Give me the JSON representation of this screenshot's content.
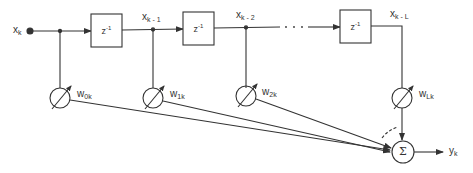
{
  "diagram": {
    "type": "adaptive transversal filter (tapped delay line)",
    "input": {
      "label": "x",
      "sub": "k"
    },
    "output": {
      "label": "y",
      "sub": "k"
    },
    "delay_blocks": [
      {
        "label": "z",
        "sup": "-1"
      },
      {
        "label": "z",
        "sup": "-1"
      },
      {
        "label": "z",
        "sup": "-1"
      }
    ],
    "taps": [
      {
        "label": "x",
        "sub": "k - 1"
      },
      {
        "label": "x",
        "sub": "k - 2"
      },
      {
        "label": "x",
        "sub": "k - L"
      }
    ],
    "ellipsis": "· · ·",
    "weights": [
      {
        "label": "w",
        "sub": "0k"
      },
      {
        "label": "w",
        "sub": "1k"
      },
      {
        "label": "w",
        "sub": "2k"
      },
      {
        "label": "w",
        "sub": "Lk"
      }
    ],
    "summer": {
      "symbol": "Σ"
    },
    "colors": {
      "line": "#333333",
      "background": "#ffffff"
    }
  }
}
